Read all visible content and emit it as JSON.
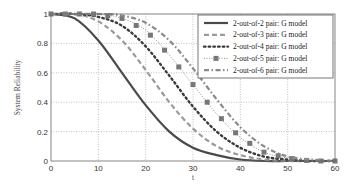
{
  "chart_data": {
    "type": "line",
    "title": "",
    "xlabel": "t",
    "ylabel": "System Reliability",
    "xlim": [
      0,
      60
    ],
    "ylim": [
      0,
      1
    ],
    "xticks": [
      0,
      10,
      20,
      30,
      40,
      50,
      60
    ],
    "yticks": [
      0,
      0.2,
      0.4,
      0.6,
      0.8,
      1
    ],
    "ytick_labels": [
      "0",
      "0.2",
      "0.4",
      "0.6",
      "0.8",
      "1"
    ],
    "grid": true,
    "legend_position": "upper right",
    "x": [
      0,
      5,
      10,
      15,
      20,
      25,
      30,
      35,
      40,
      45,
      50,
      55,
      60
    ],
    "series": [
      {
        "name": "2-out-of-2 pair: G model",
        "style": "solid",
        "color": "#4a4a4a",
        "values": [
          1.0,
          0.97,
          0.82,
          0.6,
          0.38,
          0.2,
          0.09,
          0.04,
          0.01,
          0.0,
          0.0,
          0.0,
          0.0
        ]
      },
      {
        "name": "2-out-of-3 pair: G model",
        "style": "dashed",
        "color": "#9a9a9a",
        "values": [
          1.0,
          1.0,
          0.95,
          0.82,
          0.62,
          0.4,
          0.22,
          0.1,
          0.04,
          0.01,
          0.0,
          0.0,
          0.0
        ]
      },
      {
        "name": "2-out-of-4 pair: G model",
        "style": "dotted",
        "color": "#3a3a3a",
        "values": [
          1.0,
          1.0,
          0.98,
          0.92,
          0.78,
          0.58,
          0.37,
          0.2,
          0.09,
          0.03,
          0.01,
          0.0,
          0.0
        ]
      },
      {
        "name": "2-out-of-5 pair: G model",
        "style": "dotted-square-markers",
        "color": "#7a7a7a",
        "values": [
          1.0,
          1.0,
          1.0,
          0.97,
          0.89,
          0.72,
          0.52,
          0.32,
          0.16,
          0.06,
          0.02,
          0.0,
          0.0
        ]
      },
      {
        "name": "2-out-of-6 pair: G model",
        "style": "dash-dot",
        "color": "#8a8a8a",
        "values": [
          1.0,
          1.0,
          1.0,
          0.99,
          0.94,
          0.82,
          0.63,
          0.42,
          0.23,
          0.1,
          0.03,
          0.01,
          0.0
        ]
      }
    ]
  }
}
